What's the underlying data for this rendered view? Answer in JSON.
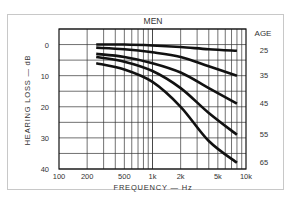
{
  "chart_data": {
    "type": "line",
    "title": "MEN",
    "xlabel": "FREQUENCY — Hz",
    "ylabel": "HEARING LOSS — dB",
    "xscale": "log",
    "xlim": [
      100,
      10000
    ],
    "ylim": [
      40,
      -5
    ],
    "y_inverted": true,
    "x_ticks": [
      100,
      200,
      500,
      1000,
      2000,
      5000,
      10000
    ],
    "x_tick_labels": [
      "100",
      "200",
      "500",
      "1k",
      "2k",
      "5k",
      "10k"
    ],
    "y_ticks": [
      0,
      10,
      20,
      30,
      40
    ],
    "y_tick_labels": [
      "0",
      "10",
      "20",
      "30",
      "40"
    ],
    "grid": true,
    "legend_title": "AGE",
    "legend_position": "right, labels aligned to curve ends",
    "x": [
      250,
      500,
      1000,
      2000,
      4000,
      8000
    ],
    "series": [
      {
        "name": "25",
        "values": [
          0,
          0,
          0.3,
          0.8,
          1.5,
          2
        ]
      },
      {
        "name": "35",
        "values": [
          1,
          1.5,
          2.5,
          4,
          7,
          10
        ]
      },
      {
        "name": "45",
        "values": [
          3,
          4,
          6,
          9,
          14,
          19
        ]
      },
      {
        "name": "55",
        "values": [
          4,
          5.5,
          8.5,
          14,
          22,
          29
        ]
      },
      {
        "name": "65",
        "values": [
          6,
          8,
          12,
          20,
          31,
          38
        ]
      }
    ]
  },
  "labels": {
    "title": "MEN",
    "legend_title": "AGE",
    "xlabel": "FREQUENCY — Hz",
    "ylabel": "HEARING LOSS — dB"
  },
  "colors": {
    "line": "#111111",
    "grid": "#333333",
    "text": "#333333",
    "frame": "#c8c8c8"
  }
}
